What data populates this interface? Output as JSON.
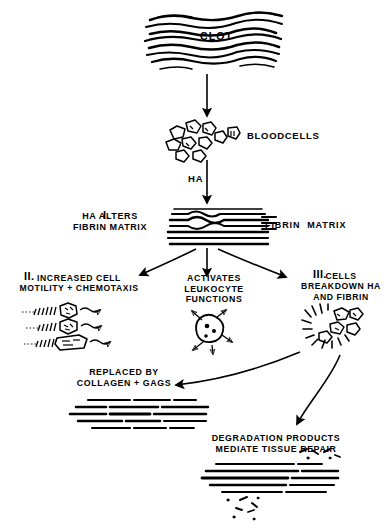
{
  "figure": {
    "background_color": "#ffffff",
    "ink_color": "#000000"
  },
  "labels": {
    "clot": "CLOT",
    "bloodcells": "BLOODCELLS",
    "ha": "HA",
    "step1_numeral": "I.",
    "step1_line1": "HA ALTERS",
    "step1_line2": "FIBRIN MATRIX",
    "fibrin_matrix_right": "FIBRIN  MATRIX",
    "step2_numeral": "II.",
    "step2_line1": "INCREASED CELL",
    "step2_line2": "MOTILITY + CHEMOTAXIS",
    "center_line1": "ACTIVATES",
    "center_line2": "LEUKOCYTE",
    "center_line3": "FUNCTIONS",
    "step3_numeral": "III.",
    "step3_line1": "CELLS",
    "step3_line2": "BREAKDOWN HA",
    "step3_line3": "AND FIBRIN",
    "replaced_line1": "REPLACED BY",
    "replaced_line2": "COLLAGEN + GAGS",
    "degradation_line1": "DEGRADATION PRODUCTS",
    "degradation_line2": "MEDIATE TISSUE REPAIR"
  },
  "illustrations": {
    "clot_mesh": "wavy-fibrin-clot-mesh",
    "bloodcell_cluster": "scattered-blood-cells",
    "fibrin_band": "horizontal-fibrin-fiber-band",
    "migrating_cells": "three-cells-with-motility-tracks-and-arrows",
    "leukocyte": "activated-leukocyte-with-radiating-arrows",
    "breakdown_cluster": "cells-degrading-fibrin-fragments",
    "collagen_band": "dense-collagen-fiber-band",
    "degradation_band": "fibrin-band-with-debris-fragments"
  },
  "connectors": [
    {
      "name": "clot-to-bloodcells",
      "from": "clot",
      "to": "bloodcells",
      "style": "straight-down-arrow"
    },
    {
      "name": "bloodcells-to-ha",
      "from": "bloodcells",
      "to": "fibrin-matrix",
      "style": "straight-down-arrow",
      "label": "HA"
    },
    {
      "name": "fork-left",
      "from": "fibrin-matrix",
      "to": "step2",
      "style": "curved-arrow"
    },
    {
      "name": "fork-center",
      "from": "fibrin-matrix",
      "to": "leukocyte",
      "style": "straight-down-arrow"
    },
    {
      "name": "fork-right",
      "from": "fibrin-matrix",
      "to": "step3",
      "style": "curved-arrow"
    },
    {
      "name": "breakdown-to-collagen",
      "from": "step3",
      "to": "replaced-by-collagen",
      "style": "curved-arrow-left"
    },
    {
      "name": "breakdown-to-degradation",
      "from": "step3",
      "to": "degradation-products",
      "style": "curved-arrow-down"
    }
  ]
}
